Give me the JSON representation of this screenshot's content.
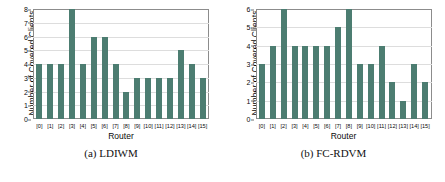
{
  "figure": {
    "panels": [
      {
        "caption": "(a) LDIWM",
        "chart_data": {
          "type": "bar",
          "title": "",
          "xlabel": "Router",
          "ylabel": "Number of Covered Clients",
          "categories": [
            "[0]",
            "[1]",
            "[2]",
            "[3]",
            "[4]",
            "[5]",
            "[6]",
            "[7]",
            "[8]",
            "[9]",
            "[10]",
            "[11]",
            "[12]",
            "[13]",
            "[14]",
            "[15]"
          ],
          "values": [
            4,
            4,
            4,
            8,
            4,
            6,
            6,
            4,
            2,
            3,
            3,
            3,
            3,
            5,
            4,
            3
          ],
          "ylim": [
            0,
            8
          ],
          "yticks": [
            0,
            1,
            2,
            3,
            4,
            5,
            6,
            7,
            8
          ],
          "grid": true,
          "legend": null,
          "bar_color": "#4c7d71"
        }
      },
      {
        "caption": "(b) FC-RDVM",
        "chart_data": {
          "type": "bar",
          "title": "",
          "xlabel": "Router",
          "ylabel": "Number of Covered Clients",
          "categories": [
            "[0]",
            "[1]",
            "[2]",
            "[3]",
            "[4]",
            "[5]",
            "[6]",
            "[7]",
            "[8]",
            "[9]",
            "[10]",
            "[11]",
            "[12]",
            "[13]",
            "[14]",
            "[15]"
          ],
          "values": [
            3,
            4,
            6,
            4,
            4,
            4,
            4,
            5,
            6,
            3,
            3,
            4,
            2,
            1,
            3,
            2
          ],
          "ylim": [
            0,
            6
          ],
          "yticks": [
            0,
            1,
            2,
            3,
            4,
            5,
            6
          ],
          "grid": true,
          "legend": null,
          "bar_color": "#4c7d71"
        }
      }
    ]
  }
}
